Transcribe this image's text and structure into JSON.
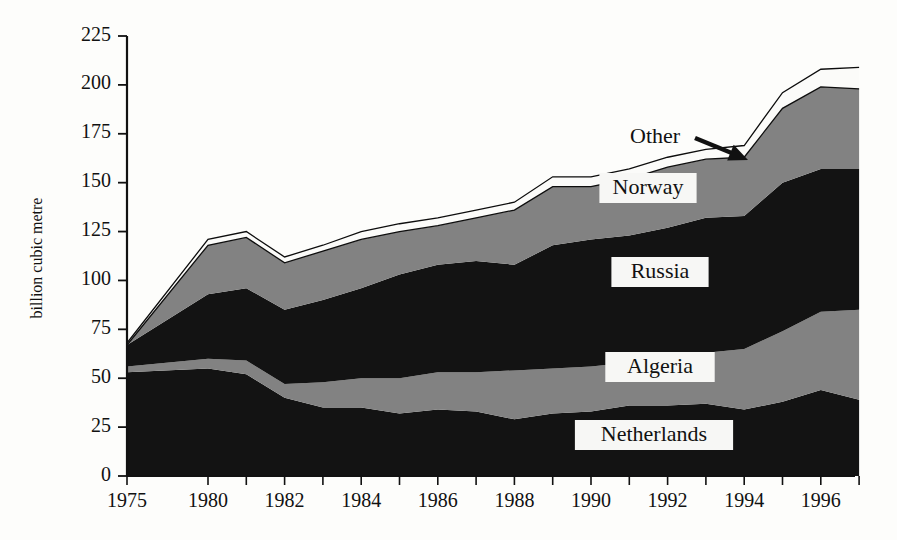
{
  "chart_data": {
    "type": "area",
    "stacked": true,
    "title": "",
    "subtitle": "",
    "xlabel": "",
    "ylabel": "billion cubic metre",
    "ylim": [
      0,
      225
    ],
    "ytick_values": [
      0,
      25,
      50,
      75,
      100,
      125,
      150,
      175,
      200,
      225
    ],
    "ytick_labels": [
      "0",
      "25",
      "50",
      "75",
      "100",
      "125",
      "150",
      "175",
      "200",
      "225"
    ],
    "grid": false,
    "legend_position": "inline-labels",
    "x": [
      1975,
      1980,
      1981,
      1982,
      1983,
      1984,
      1985,
      1986,
      1987,
      1988,
      1989,
      1990,
      1991,
      1992,
      1993,
      1994,
      1995,
      1996,
      1997
    ],
    "xtick_labels_shown": [
      "1975",
      "1980",
      "1982",
      "1984",
      "1986",
      "1988",
      "1990",
      "1992",
      "1994",
      "1996"
    ],
    "xtick_label_years": [
      1975,
      1980,
      1982,
      1984,
      1986,
      1988,
      1990,
      1992,
      1994,
      1996
    ],
    "series": [
      {
        "name": "Netherlands",
        "color": "#131313",
        "values": [
          53,
          55,
          52,
          40,
          35,
          35,
          32,
          34,
          33,
          29,
          32,
          33,
          36,
          36,
          37,
          34,
          38,
          44,
          39
        ]
      },
      {
        "name": "Algeria",
        "color": "#828282",
        "values": [
          3,
          5,
          7,
          7,
          13,
          15,
          18,
          19,
          20,
          25,
          23,
          23,
          22,
          25,
          26,
          31,
          36,
          40,
          46
        ]
      },
      {
        "name": "Russia",
        "color": "#131313",
        "values": [
          11,
          33,
          37,
          38,
          42,
          46,
          53,
          55,
          57,
          54,
          63,
          65,
          65,
          66,
          69,
          68,
          76,
          73,
          72
        ]
      },
      {
        "name": "Norway",
        "color": "#828282",
        "values": [
          0,
          25,
          26,
          24,
          25,
          25,
          22,
          20,
          22,
          28,
          30,
          27,
          29,
          31,
          30,
          30,
          38,
          42,
          41
        ]
      },
      {
        "name": "Other",
        "color": "#fbfbf9",
        "values": [
          1,
          3,
          3,
          3,
          3,
          4,
          4,
          4,
          4,
          4,
          5,
          5,
          5,
          5,
          5,
          6,
          8,
          9,
          11
        ]
      }
    ],
    "totals": [
      68,
      121,
      125,
      112,
      118,
      125,
      129,
      132,
      136,
      140,
      153,
      153,
      157,
      163,
      167,
      169,
      196,
      208,
      209
    ],
    "annotations": [
      {
        "name": "other-callout",
        "text": "Other",
        "arrow_from": [
          695,
          138
        ],
        "arrow_to": [
          748,
          160
        ]
      }
    ],
    "series_labels": [
      {
        "name": "Norway",
        "text": "Norway",
        "cx": 648,
        "cy": 188
      },
      {
        "name": "Russia",
        "text": "Russia",
        "cx": 660,
        "cy": 272
      },
      {
        "name": "Algeria",
        "text": "Algeria",
        "cx": 660,
        "cy": 367
      },
      {
        "name": "Netherlands",
        "text": "Netherlands",
        "cx": 654,
        "cy": 435
      }
    ]
  },
  "geometry": {
    "plot_left": 127,
    "plot_right": 855,
    "plot_top": 36,
    "plot_bottom": 476,
    "year_first": 1975,
    "year_gap_px": 81,
    "year_step_px": 38.3
  },
  "colors": {
    "dark": "#131313",
    "gray": "#828282",
    "white": "#fbfbf9",
    "axis": "#111111",
    "page_background": "#fdfdfb"
  }
}
